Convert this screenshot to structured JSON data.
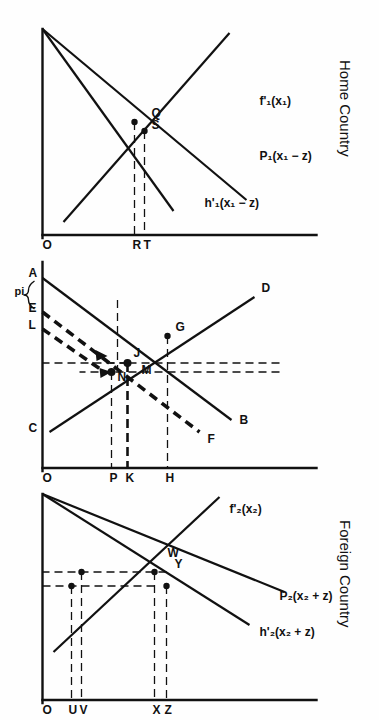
{
  "figure": {
    "orientation": "rotated-90-clockwise",
    "panels": [
      {
        "id": "home",
        "title": "Home Country",
        "curves": [
          {
            "id": "f1",
            "label": "f'₁(x₁)"
          },
          {
            "id": "P1",
            "label": "P₁(x₁ − z)"
          },
          {
            "id": "h1",
            "label": "h'₁(x₁ − z)"
          }
        ],
        "axis_ticks": [
          "O",
          "R",
          "T"
        ],
        "point_labels": [
          "Q",
          "S"
        ]
      },
      {
        "id": "market",
        "title": "",
        "curves": [
          {
            "id": "D",
            "label": "D"
          },
          {
            "id": "B",
            "label": "B"
          },
          {
            "id": "F",
            "label": "F"
          }
        ],
        "axis_ticks": [
          "O",
          "P",
          "K",
          "H"
        ],
        "baseline_labels": [
          "A",
          "pi",
          "E",
          "L",
          "C"
        ],
        "point_labels": [
          "G",
          "J",
          "M",
          "N"
        ]
      },
      {
        "id": "foreign",
        "title": "Foreign Country",
        "curves": [
          {
            "id": "f2",
            "label": "f'₂(x₂)"
          },
          {
            "id": "P2",
            "label": "P₂(x₂ + z)"
          },
          {
            "id": "h2",
            "label": "h'₂(x₂ + z)"
          }
        ],
        "axis_ticks": [
          "O",
          "U",
          "V",
          "X",
          "Z"
        ],
        "point_labels": [
          "W",
          "Y"
        ]
      }
    ],
    "colors": {
      "ink": "#111111",
      "paper": "#fefefe"
    }
  }
}
